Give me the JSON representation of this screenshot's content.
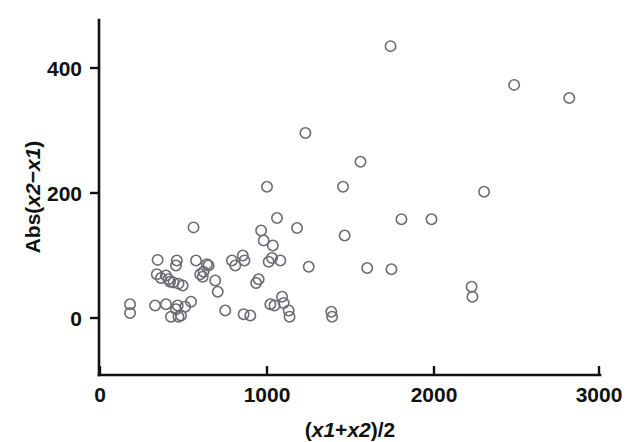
{
  "chart_data": {
    "type": "scatter",
    "title": "",
    "xlabel": "(x1+x2)/2",
    "ylabel": "Abs(x2−x1)",
    "xlim": [
      0,
      3000
    ],
    "ylim": [
      -80,
      470
    ],
    "grid": false,
    "legend": "none",
    "marker": "open-circle",
    "marker_color": "#6b6b73",
    "xticks": [
      0,
      1000,
      2000,
      3000
    ],
    "xtick_labels": [
      "0",
      "1000",
      "2000",
      "3000"
    ],
    "yticks": [
      0,
      200,
      400
    ],
    "ytick_labels": [
      "0",
      "200",
      "400"
    ],
    "points": [
      {
        "x": 180,
        "y": 22
      },
      {
        "x": 180,
        "y": 8
      },
      {
        "x": 345,
        "y": 93
      },
      {
        "x": 340,
        "y": 70
      },
      {
        "x": 365,
        "y": 64
      },
      {
        "x": 395,
        "y": 68
      },
      {
        "x": 410,
        "y": 62
      },
      {
        "x": 420,
        "y": 58
      },
      {
        "x": 440,
        "y": 57
      },
      {
        "x": 455,
        "y": 84
      },
      {
        "x": 460,
        "y": 92
      },
      {
        "x": 470,
        "y": 55
      },
      {
        "x": 495,
        "y": 52
      },
      {
        "x": 330,
        "y": 20
      },
      {
        "x": 395,
        "y": 22
      },
      {
        "x": 425,
        "y": 2
      },
      {
        "x": 455,
        "y": 14
      },
      {
        "x": 465,
        "y": 20
      },
      {
        "x": 470,
        "y": 2
      },
      {
        "x": 485,
        "y": 4
      },
      {
        "x": 510,
        "y": 18
      },
      {
        "x": 545,
        "y": 26
      },
      {
        "x": 560,
        "y": 145
      },
      {
        "x": 575,
        "y": 92
      },
      {
        "x": 600,
        "y": 70
      },
      {
        "x": 615,
        "y": 66
      },
      {
        "x": 620,
        "y": 74
      },
      {
        "x": 640,
        "y": 86
      },
      {
        "x": 650,
        "y": 84
      },
      {
        "x": 690,
        "y": 60
      },
      {
        "x": 705,
        "y": 42
      },
      {
        "x": 750,
        "y": 12
      },
      {
        "x": 790,
        "y": 92
      },
      {
        "x": 810,
        "y": 84
      },
      {
        "x": 855,
        "y": 100
      },
      {
        "x": 865,
        "y": 92
      },
      {
        "x": 860,
        "y": 6
      },
      {
        "x": 900,
        "y": 4
      },
      {
        "x": 935,
        "y": 56
      },
      {
        "x": 950,
        "y": 62
      },
      {
        "x": 965,
        "y": 140
      },
      {
        "x": 980,
        "y": 124
      },
      {
        "x": 1000,
        "y": 210
      },
      {
        "x": 1010,
        "y": 90
      },
      {
        "x": 1030,
        "y": 96
      },
      {
        "x": 1035,
        "y": 116
      },
      {
        "x": 1060,
        "y": 160
      },
      {
        "x": 1080,
        "y": 92
      },
      {
        "x": 1020,
        "y": 22
      },
      {
        "x": 1045,
        "y": 20
      },
      {
        "x": 1090,
        "y": 34
      },
      {
        "x": 1100,
        "y": 24
      },
      {
        "x": 1130,
        "y": 12
      },
      {
        "x": 1135,
        "y": 2
      },
      {
        "x": 1180,
        "y": 144
      },
      {
        "x": 1230,
        "y": 296
      },
      {
        "x": 1250,
        "y": 82
      },
      {
        "x": 1385,
        "y": 10
      },
      {
        "x": 1390,
        "y": 2
      },
      {
        "x": 1455,
        "y": 210
      },
      {
        "x": 1465,
        "y": 132
      },
      {
        "x": 1560,
        "y": 250
      },
      {
        "x": 1600,
        "y": 80
      },
      {
        "x": 1740,
        "y": 435
      },
      {
        "x": 1745,
        "y": 78
      },
      {
        "x": 1805,
        "y": 158
      },
      {
        "x": 1985,
        "y": 158
      },
      {
        "x": 2225,
        "y": 50
      },
      {
        "x": 2230,
        "y": 34
      },
      {
        "x": 2300,
        "y": 202
      },
      {
        "x": 2480,
        "y": 373
      },
      {
        "x": 2810,
        "y": 352
      }
    ]
  },
  "axis": {
    "y_title_parts": {
      "prefix": "Abs(",
      "var1": "x2",
      "minus": "−",
      "var2": "x1",
      "suffix": ")"
    },
    "x_title_parts": {
      "open": "(",
      "var1": "x1",
      "plus": "+",
      "var2": "x2",
      "close": ")/2"
    }
  }
}
